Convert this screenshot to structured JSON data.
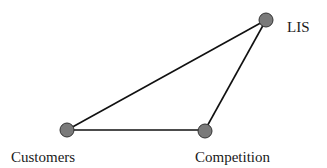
{
  "diagram": {
    "type": "network",
    "node_color": "#7a7a7a",
    "edge_color": "#111111",
    "nodes": [
      {
        "id": "lis",
        "label": "LIS"
      },
      {
        "id": "customers",
        "label": "Customers"
      },
      {
        "id": "competition",
        "label": "Competition"
      }
    ],
    "edges": [
      {
        "from": "customers",
        "to": "lis"
      },
      {
        "from": "customers",
        "to": "competition"
      },
      {
        "from": "competition",
        "to": "lis"
      }
    ]
  }
}
